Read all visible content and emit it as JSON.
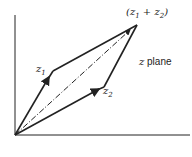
{
  "diagram": {
    "labels": {
      "sum": {
        "open": "(z",
        "sub1": "1",
        "plus": " + z",
        "sub2": "2",
        "close": ")"
      },
      "z1": {
        "base": "z",
        "sub": "1"
      },
      "z2": {
        "base": "z",
        "sub": "2"
      },
      "plane_var": "z",
      "plane_word": " plane"
    },
    "points": {
      "origin": [
        15,
        135
      ],
      "z1": [
        53,
        71
      ],
      "z2": [
        104,
        87
      ],
      "sum": [
        137,
        25
      ]
    },
    "colors": {
      "line": "#222222",
      "background": "#ffffff"
    }
  }
}
